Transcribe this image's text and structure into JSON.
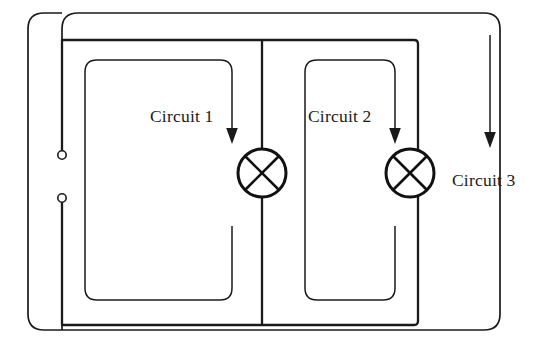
{
  "diagram": {
    "background_color": "#ffffff",
    "line_color": "#1a1a1a",
    "labels": {
      "circuit_1": "Circuit 1",
      "circuit_2": "Circuit 2",
      "circuit_3": "Circuit 3"
    },
    "components": {
      "lamp_1_name": "lamp-symbol",
      "lamp_2_name": "lamp-symbol",
      "terminal_top_name": "terminal-open-circle",
      "terminal_bottom_name": "terminal-open-circle"
    },
    "geometry": {
      "width": 542,
      "height": 346,
      "outer_loop": {
        "x": 28,
        "y": 13,
        "w": 472,
        "h": 317,
        "radius": 16
      },
      "inner_rail": {
        "x": 62,
        "y": 40,
        "w": 356,
        "h": 285,
        "radius": 4
      },
      "divider_x": 262,
      "lamp_1": {
        "cx": 262,
        "cy": 173,
        "r": 24
      },
      "lamp_2": {
        "cx": 410,
        "cy": 173,
        "r": 24
      },
      "terminal_top": {
        "cx": 62,
        "cy": 155,
        "r": 4
      },
      "terminal_bottom": {
        "cx": 62,
        "cy": 198,
        "r": 4
      },
      "circuit_3_arrow_x": 490,
      "circuit_3_arrow_y_start": 35,
      "circuit_3_arrow_y_end": 148
    }
  }
}
